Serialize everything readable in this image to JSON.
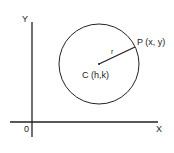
{
  "diagram": {
    "axes": {
      "x_label": "X",
      "y_label": "Y",
      "origin_label": "0"
    },
    "circle": {
      "center_label": "C (h,k)",
      "point_label": "P (x, y)",
      "radius_label": "r"
    },
    "colors": {
      "stroke": "#222222",
      "background": "#ffffff"
    }
  }
}
